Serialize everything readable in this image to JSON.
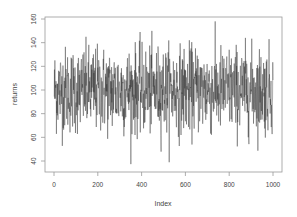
{
  "chart_data": {
    "type": "line",
    "title": "",
    "xlabel": "Index",
    "ylabel": "returns",
    "xlim": [
      0,
      1000
    ],
    "ylim": [
      35,
      162
    ],
    "x_ticks": [
      0,
      200,
      400,
      600,
      800,
      1000
    ],
    "y_ticks": [
      40,
      60,
      80,
      100,
      120,
      140,
      160
    ],
    "grid": false,
    "legend": null,
    "n_points": 1000,
    "mean": 100,
    "sd": 18,
    "min_approx": 35,
    "max_approx": 158,
    "series": [
      {
        "name": "returns",
        "color": "#333333",
        "description": "noisy series of 1000 points fluctuating around 100, ranging roughly 35 to 158"
      }
    ]
  },
  "colors": {
    "line": "#333333",
    "axis": "#888888",
    "background": "#ffffff"
  }
}
